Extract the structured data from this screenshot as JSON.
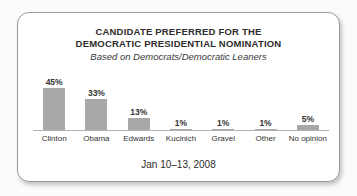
{
  "card": {
    "title_line1": "CANDIDATE PREFERRED FOR THE",
    "title_line2": "DEMOCRATIC PRESIDENTIAL NOMINATION",
    "subtitle": "Based on Democrats/Democratic Leaners",
    "footer": "Jan 10–13, 2008"
  },
  "chart_data": {
    "type": "bar",
    "title": "CANDIDATE PREFERRED FOR THE DEMOCRATIC PRESIDENTIAL NOMINATION",
    "subtitle": "Based on Democrats/Democratic Leaners",
    "footer": "Jan 10–13, 2008",
    "categories": [
      "Clinton",
      "Obama",
      "Edwards",
      "Kucinich",
      "Gravel",
      "Other",
      "No opinion"
    ],
    "values": [
      45,
      33,
      13,
      1,
      1,
      1,
      5
    ],
    "value_labels": [
      "45%",
      "33%",
      "13%",
      "1%",
      "1%",
      "1%",
      "5%"
    ],
    "xlabel": "",
    "ylabel": "",
    "ylim": [
      0,
      50
    ],
    "grid": false,
    "legend": "none",
    "bar_color": "#a8a8a8",
    "axis_color": "#b3b3b3",
    "text_color": "#333333"
  }
}
